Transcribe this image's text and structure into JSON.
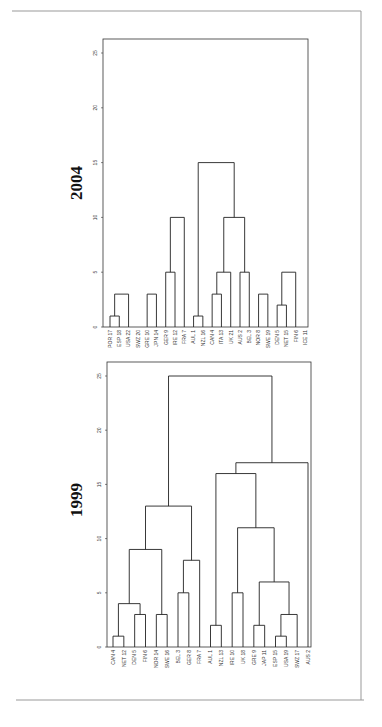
{
  "chart_data": [
    {
      "type": "dendrogram",
      "title": "2004",
      "ylabel": "",
      "ylim": [
        0,
        25
      ],
      "yticks": [
        0,
        5,
        10,
        15,
        20,
        25
      ],
      "leaves": [
        "POR 17",
        "ESP 18",
        "USA 22",
        "SWZ 20",
        "GRE 10",
        "JPN 14",
        "GER 9",
        "IRE 12",
        "FRA 7",
        "AUL 1",
        "NZL 16",
        "CAN 4",
        "ITA 13",
        "UK 21",
        "AUS 2",
        "BEL 3",
        "NOR 8",
        "SWE 19",
        "DEN 5",
        "NET 15",
        "FIN 6",
        "ICE 11"
      ],
      "merges": [
        {
          "left": [
            0
          ],
          "right": [
            1
          ],
          "height": 1
        },
        {
          "left": [
            0,
            1
          ],
          "right": [
            2
          ],
          "height": 3
        },
        {
          "left": [
            4
          ],
          "right": [
            5
          ],
          "height": 3
        },
        {
          "left": [
            0,
            1,
            2
          ],
          "right": [
            3,
            4,
            5
          ],
          "height": 5
        },
        {
          "left": [
            6
          ],
          "right": [
            7
          ],
          "height": 5
        },
        {
          "left": [
            6,
            7
          ],
          "right": [
            8
          ],
          "height": 10
        },
        {
          "left": [
            0,
            1,
            2,
            3,
            4,
            5
          ],
          "right": [
            6,
            7,
            8
          ],
          "height": 11
        },
        {
          "left": [
            9
          ],
          "right": [
            10
          ],
          "height": 1
        },
        {
          "left": [
            11
          ],
          "right": [
            12
          ],
          "height": 3
        },
        {
          "left": [
            11,
            12
          ],
          "right": [
            13
          ],
          "height": 5
        },
        {
          "left": [
            14
          ],
          "right": [
            15
          ],
          "height": 5
        },
        {
          "left": [
            11,
            12,
            13
          ],
          "right": [
            14,
            15
          ],
          "height": 10
        },
        {
          "left": [
            9,
            10
          ],
          "right": [
            11,
            12,
            13,
            14,
            15
          ],
          "height": 15
        },
        {
          "left": [
            0,
            1,
            2,
            3,
            4,
            5,
            6,
            7,
            8
          ],
          "right": [
            9,
            10,
            11,
            12,
            13,
            14,
            15
          ],
          "height": 17
        },
        {
          "left": [
            16
          ],
          "right": [
            17
          ],
          "height": 3
        },
        {
          "left": [
            18
          ],
          "right": [
            19
          ],
          "height": 2
        },
        {
          "left": [
            18,
            19
          ],
          "right": [
            20
          ],
          "height": 5
        },
        {
          "left": [
            16,
            17
          ],
          "right": [
            18,
            19,
            20,
            21
          ],
          "height": 6
        },
        {
          "left": [
            0,
            1,
            2,
            3,
            4,
            5,
            6,
            7,
            8,
            9,
            10,
            11,
            12,
            13,
            14,
            15
          ],
          "right": [
            16,
            17,
            18,
            19,
            20,
            21
          ],
          "height": 25
        }
      ]
    },
    {
      "type": "dendrogram",
      "title": "1999",
      "ylabel": "",
      "ylim": [
        0,
        25
      ],
      "yticks": [
        0,
        5,
        10,
        15,
        20,
        25
      ],
      "leaves": [
        "CAN 4",
        "NET 12",
        "DEN 5",
        "FIN 6",
        "NOR 14",
        "SWE 16",
        "BEL 3",
        "GER 8",
        "FRA 7",
        "AUL 1",
        "NZL 13",
        "IRE 10",
        "UK 18",
        "GRE 9",
        "JAP 11",
        "ESP 15",
        "USA 19",
        "SWZ 17",
        "AUS 2"
      ],
      "merges": [
        {
          "left": [
            0
          ],
          "right": [
            1
          ],
          "height": 1
        },
        {
          "left": [
            2
          ],
          "right": [
            3
          ],
          "height": 3
        },
        {
          "left": [
            0,
            1
          ],
          "right": [
            2,
            3
          ],
          "height": 4
        },
        {
          "left": [
            4
          ],
          "right": [
            5
          ],
          "height": 3
        },
        {
          "left": [
            0,
            1,
            2,
            3
          ],
          "right": [
            4,
            5
          ],
          "height": 9
        },
        {
          "left": [
            6
          ],
          "right": [
            7
          ],
          "height": 5
        },
        {
          "left": [
            6,
            7
          ],
          "right": [
            8
          ],
          "height": 8
        },
        {
          "left": [
            0,
            1,
            2,
            3,
            4,
            5
          ],
          "right": [
            6,
            7,
            8
          ],
          "height": 13
        },
        {
          "left": [
            9
          ],
          "right": [
            10
          ],
          "height": 2
        },
        {
          "left": [
            11
          ],
          "right": [
            12
          ],
          "height": 5
        },
        {
          "left": [
            13
          ],
          "right": [
            14
          ],
          "height": 2
        },
        {
          "left": [
            15
          ],
          "right": [
            16
          ],
          "height": 1
        },
        {
          "left": [
            15,
            16
          ],
          "right": [
            17
          ],
          "height": 3
        },
        {
          "left": [
            13,
            14
          ],
          "right": [
            15,
            16,
            17
          ],
          "height": 6
        },
        {
          "left": [
            11,
            12
          ],
          "right": [
            13,
            14,
            15,
            16,
            17
          ],
          "height": 11
        },
        {
          "left": [
            9,
            10
          ],
          "right": [
            11,
            12,
            13,
            14,
            15,
            16,
            17
          ],
          "height": 16
        },
        {
          "left": [
            9,
            10,
            11,
            12,
            13,
            14,
            15,
            16,
            17
          ],
          "right": [
            18
          ],
          "height": 17
        },
        {
          "left": [
            0,
            1,
            2,
            3,
            4,
            5,
            6,
            7,
            8
          ],
          "right": [
            9,
            10,
            11,
            12,
            13,
            14,
            15,
            16,
            17,
            18
          ],
          "height": 25
        }
      ]
    }
  ],
  "figure": {
    "panels": [
      {
        "title": "2004"
      },
      {
        "title": "1999"
      }
    ]
  }
}
